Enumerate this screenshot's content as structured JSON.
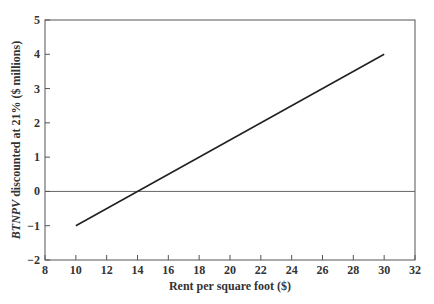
{
  "chart_data": {
    "type": "line",
    "title": "",
    "xlabel": "Rent per square foot ($)",
    "ylabel_italic": "BTNPV",
    "ylabel_rest": " discounted at 21% ($ millions)",
    "ylabel": "BTNPV discounted at 21% ($ millions)",
    "xlim": [
      8,
      32
    ],
    "ylim": [
      -2,
      5
    ],
    "xticks": [
      8,
      10,
      12,
      14,
      16,
      18,
      20,
      22,
      24,
      26,
      28,
      30,
      32
    ],
    "yticks": [
      -2,
      -1,
      0,
      1,
      2,
      3,
      4,
      5
    ],
    "grid": false,
    "reference_line_y": 0,
    "series": [
      {
        "name": "BTNPV",
        "x": [
          10,
          30
        ],
        "y": [
          -1,
          4
        ]
      }
    ],
    "zero_crossing_x": 14,
    "colors": {
      "line": "#222222",
      "axis": "#555555",
      "zero_line": "#666666"
    }
  }
}
